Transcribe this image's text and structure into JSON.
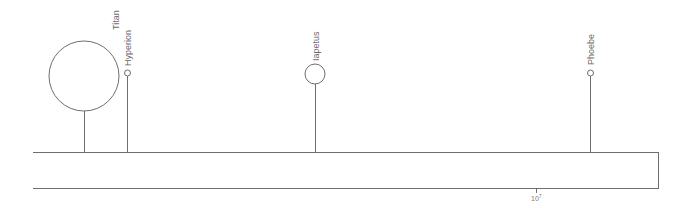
{
  "diagram": {
    "type": "orbital distance scale (log axis)",
    "axis": {
      "tick_label_base": "10",
      "tick_label_exp": "7",
      "tick_label": "10^7"
    },
    "moons": [
      {
        "name": "Titan",
        "x": 84,
        "cy": 76,
        "r": 35
      },
      {
        "name": "Hyperion",
        "x": 127,
        "cy": 73,
        "r": 3
      },
      {
        "name": "Iapetus",
        "x": 315,
        "cy": 74,
        "r": 10
      },
      {
        "name": "Phoebe",
        "x": 590,
        "cy": 73,
        "r": 3
      }
    ],
    "colors": {
      "line": "#6e6e6e",
      "label": "#6a6a6a",
      "background": "#ffffff"
    }
  }
}
